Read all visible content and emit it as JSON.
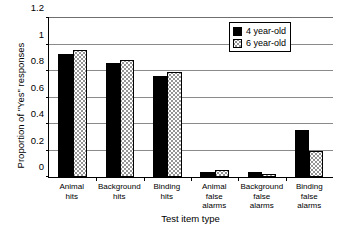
{
  "chart_data": {
    "type": "bar",
    "title": "",
    "xlabel": "Test item type",
    "ylabel": "Proportion of \"Yes\" responses",
    "ylim": [
      0,
      1.2
    ],
    "ytick_labels": [
      "0",
      "0.2",
      "0.4",
      "0.6",
      "0.8",
      "1",
      "1.2"
    ],
    "ytick_values": [
      0,
      0.2,
      0.4,
      0.6,
      0.8,
      1,
      1.2
    ],
    "grid": "horizontal",
    "legend_position": "top-right",
    "categories": [
      "Animal\nhits",
      "Background\nhits",
      "Binding\nhits",
      "Animal\nfalse\nalarms",
      "Background\nfalse\nalarms",
      "Binding\nfalse\nalarms"
    ],
    "series": [
      {
        "name": "4 year-old",
        "color": "#000000",
        "pattern": "solid-black",
        "values": [
          0.93,
          0.86,
          0.765,
          0.04,
          0.035,
          0.355
        ]
      },
      {
        "name": "6 year-old",
        "color": "#ffffff",
        "pattern": "dotted-stipple",
        "values": [
          0.955,
          0.88,
          0.79,
          0.055,
          0.025,
          0.195
        ]
      }
    ]
  },
  "legend": {
    "entries": [
      {
        "label": "4 year-old"
      },
      {
        "label": "6 year-old"
      }
    ]
  }
}
